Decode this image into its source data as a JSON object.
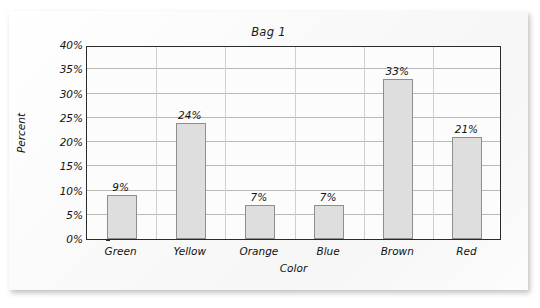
{
  "chart_data": {
    "type": "bar",
    "title": "Bag 1",
    "xlabel": "Color",
    "ylabel": "Percent",
    "categories": [
      "Green",
      "Yellow",
      "Orange",
      "Blue",
      "Brown",
      "Red"
    ],
    "values": [
      9,
      24,
      7,
      7,
      33,
      21
    ],
    "data_labels": [
      "9%",
      "24%",
      "7%",
      "7%",
      "33%",
      "21%"
    ],
    "ylim": [
      0,
      40
    ],
    "ytick_values": [
      0,
      5,
      10,
      15,
      20,
      25,
      30,
      35,
      40
    ],
    "ytick_labels": [
      "0%",
      "5%",
      "10%",
      "15%",
      "20%",
      "25%",
      "30%",
      "35%",
      "40%"
    ],
    "grid": "horizontal",
    "legend": "none",
    "colors": {
      "bar_fill": "#dedede",
      "bar_border": "#8e8e8e",
      "axis": "#2b2b2b",
      "gridline": "#b9b9b9",
      "text": "#111111",
      "paper": "#fbfbfb"
    }
  }
}
